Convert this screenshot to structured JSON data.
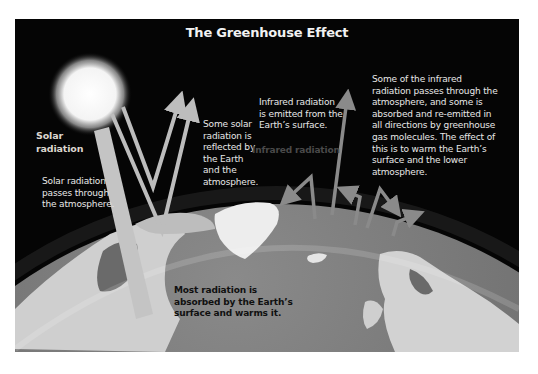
{
  "title": "The Greenhouse Effect",
  "labels": {
    "solar_radiation": [
      "Solar",
      "radiation"
    ],
    "solar_passes": [
      "Solar radiation",
      "passes through",
      "the atmosphere."
    ],
    "reflected": [
      "Some solar",
      "radiation is",
      "reflected by",
      "the Earth",
      "and the",
      "atmosphere."
    ],
    "infrared_emitted": [
      "Infrared radiation",
      "is emitted from the",
      "Earth’s surface."
    ],
    "infrared_faint": "Infrared radiation",
    "greenhouse_gas": [
      "Some of the infrared",
      "radiation passes through the",
      "atmosphere, and some is",
      "absorbed and re-emitted in",
      "all directions by greenhouse",
      "gas molecules.  The effect of",
      "this is to warm the Earth’s",
      "surface and the lower",
      "atmosphere."
    ],
    "absorbed": [
      "Most radiation is",
      "absorbed by the Earth’s",
      "surface and warms it."
    ]
  },
  "colors": {
    "background": "#050505",
    "frame": "#ffffff",
    "text": "#e8e8e8",
    "arrow": "#bdbdbd",
    "infrared_arrow": "#8a8a8a",
    "earth_ocean": "#6e6e6e",
    "earth_land": "#d4d4d4",
    "sun": "#ffffff"
  },
  "icons": {
    "sun": "sun-icon",
    "earth": "earth-globe",
    "solar_arrows": "solar-radiation-arrows",
    "infrared_arrows": "infrared-radiation-arrows"
  }
}
